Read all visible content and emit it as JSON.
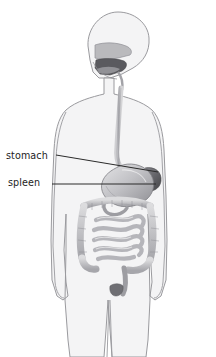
{
  "figure": {
    "title_clipped": "gastrointestinal",
    "background_color": "#ffffff",
    "body_fill_color": "#f4f4f5",
    "body_outline_color": "#9a9a9e",
    "organ_light_color": "#d9d9db",
    "organ_mid_color": "#b0b0b3",
    "organ_dark_color": "#6e6e72",
    "spleen_color": "#5d5d62",
    "leader_line_color": "#2a2a2a",
    "label_text_color": "#1d1d1d"
  },
  "labels": [
    {
      "id": "stomach",
      "text": "stomach",
      "x": 6,
      "y": 150,
      "leader": {
        "x1": 56,
        "y1": 155,
        "x2": 158,
        "y2": 172
      }
    },
    {
      "id": "spleen",
      "text": "spleen",
      "x": 8,
      "y": 177,
      "leader": {
        "x1": 52,
        "y1": 184,
        "x2": 156,
        "y2": 184
      }
    }
  ],
  "anatomy": {
    "head": "human head in profile, facing left",
    "oral_cavity": "mouth and tongue cavity shaded dark",
    "nasal_passage": "nasal cavity above palate",
    "esophagus": "tube descending from pharynx through thorax to stomach",
    "stomach": "J-shaped stomach at upper abdomen",
    "spleen": "dark oval organ at upper-left of stomach",
    "small_intestine": "coiled loops filling central abdomen",
    "large_intestine": "colon framing the small intestine",
    "rectum": "terminal segment descending to pelvis",
    "torso": "outline of human torso with shoulders and arms",
    "legs": "two legs extending to bottom edge of image"
  }
}
